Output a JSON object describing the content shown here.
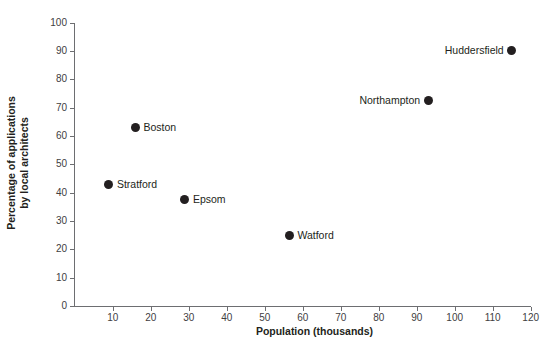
{
  "chart_data": {
    "type": "scatter",
    "title": "",
    "xlabel": "Population (thousands)",
    "ylabel": "Percentage of applications by local architects",
    "ylabel_lines": [
      "Percentage of applications",
      "by local architects"
    ],
    "xlim": [
      0,
      120
    ],
    "ylim": [
      0,
      100
    ],
    "xticks": [
      0,
      10,
      20,
      30,
      40,
      50,
      60,
      70,
      80,
      90,
      100,
      110,
      120
    ],
    "yticks": [
      0,
      10,
      20,
      30,
      40,
      50,
      60,
      70,
      80,
      90,
      100
    ],
    "grid": false,
    "legend": "none",
    "marker_color": "#231f20",
    "axis_color": "#6d6e71",
    "points": [
      {
        "label": "Stratford",
        "x": 9,
        "y": 43,
        "label_side": "right"
      },
      {
        "label": "Boston",
        "x": 16,
        "y": 63,
        "label_side": "right"
      },
      {
        "label": "Epsom",
        "x": 29,
        "y": 37.5,
        "label_side": "right"
      },
      {
        "label": "Watford",
        "x": 56.5,
        "y": 25,
        "label_side": "right"
      },
      {
        "label": "Northampton",
        "x": 93,
        "y": 72.5,
        "label_side": "left"
      },
      {
        "label": "Huddersfield",
        "x": 115,
        "y": 90,
        "label_side": "left"
      }
    ]
  }
}
